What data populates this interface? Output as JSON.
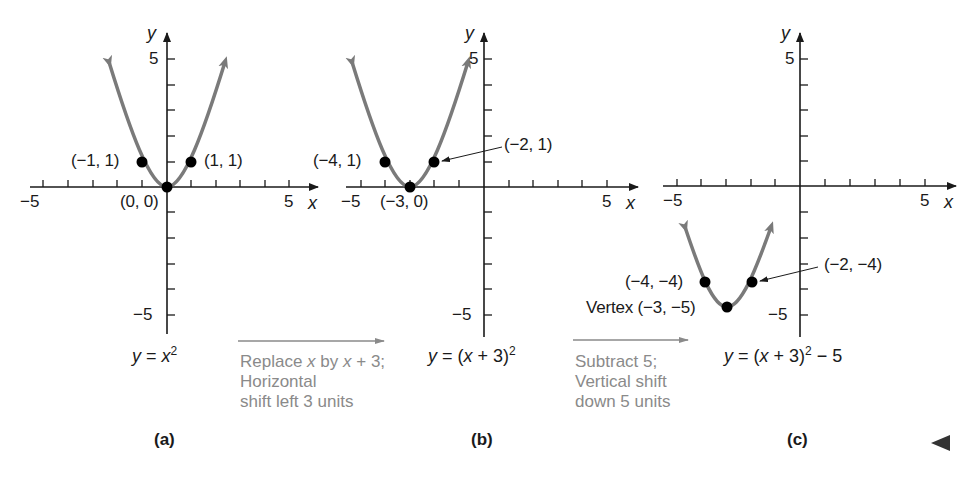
{
  "figure": {
    "panels": [
      {
        "id": "a",
        "caption": "(a)",
        "equation_prefix": "y",
        "equation_mid": " = ",
        "equation_body": "x",
        "equation_exp": "2",
        "equation_tail": "",
        "axis": {
          "x_label": "x",
          "y_label": "y",
          "x_min_tick": "−5",
          "x_max_tick": "5",
          "y_max_tick": "5",
          "y_min_tick": "−5"
        },
        "points": [
          {
            "label": "(−1, 1)",
            "x": -1,
            "y": 1
          },
          {
            "label": "(0, 0)",
            "x": 0,
            "y": 0
          },
          {
            "label": "(1, 1)",
            "x": 1,
            "y": 1
          }
        ]
      },
      {
        "id": "b",
        "caption": "(b)",
        "equation_prefix": "y",
        "equation_mid": " = (",
        "equation_body": "x",
        "equation_exp": "2",
        "equation_tail": " + 3)",
        "axis": {
          "x_label": "x",
          "y_label": "y",
          "x_min_tick": "−5",
          "x_max_tick": "5",
          "y_max_tick": "5",
          "y_min_tick": "−5"
        },
        "points": [
          {
            "label": "(−4, 1)",
            "x": -4,
            "y": 1
          },
          {
            "label": "(−3, 0)",
            "x": -3,
            "y": 0
          },
          {
            "label": "(−2, 1)",
            "x": -2,
            "y": 1
          }
        ]
      },
      {
        "id": "c",
        "caption": "(c)",
        "equation_prefix": "y",
        "equation_mid": " = (",
        "equation_body": "x",
        "equation_exp": "2",
        "equation_tail": " + 3)",
        "equation_after": " − 5",
        "axis": {
          "x_label": "x",
          "y_label": "y",
          "x_min_tick": "−5",
          "x_max_tick": "5",
          "y_max_tick": "5",
          "y_min_tick": "−5"
        },
        "points": [
          {
            "label": "(−4, −4)",
            "x": -4,
            "y": -4
          },
          {
            "label": "Vertex (−3, −5)",
            "x": -3,
            "y": -5
          },
          {
            "label": "(−2, −4)",
            "x": -2,
            "y": -4
          }
        ]
      }
    ],
    "transforms": [
      {
        "line1_a": "Replace ",
        "line1_var": "x",
        "line1_b": " by ",
        "line1_var2": "x",
        "line1_c": " + 3;",
        "line2": "Horizontal",
        "line3": "shift left 3 units"
      },
      {
        "line1": "Subtract 5;",
        "line2": "Vertical shift",
        "line3": "down 5 units"
      }
    ],
    "colors": {
      "curve": "#7a7a7a",
      "axis": "#1a1a1a",
      "point": "#000000",
      "note": "#8a8a8a"
    },
    "nav_icon": "previous-triangle-icon"
  }
}
